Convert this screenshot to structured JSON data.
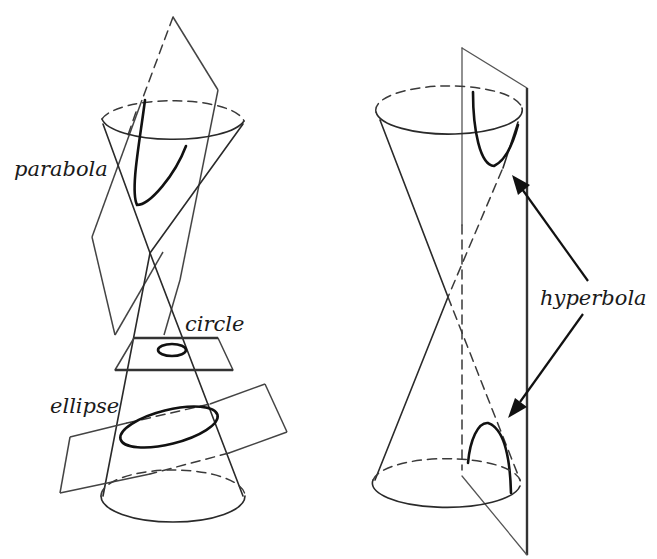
{
  "figure": {
    "left_panel": {
      "description": "Double cone cut by three planes",
      "labels": {
        "parabola": "parabola",
        "circle": "circle",
        "ellipse": "ellipse"
      }
    },
    "right_panel": {
      "description": "Double cone cut by a vertical plane",
      "labels": {
        "hyperbola": "hyperbola"
      }
    },
    "colors": {
      "stroke": "#2a2a2a",
      "curve": "#111111",
      "background": "#ffffff"
    }
  }
}
